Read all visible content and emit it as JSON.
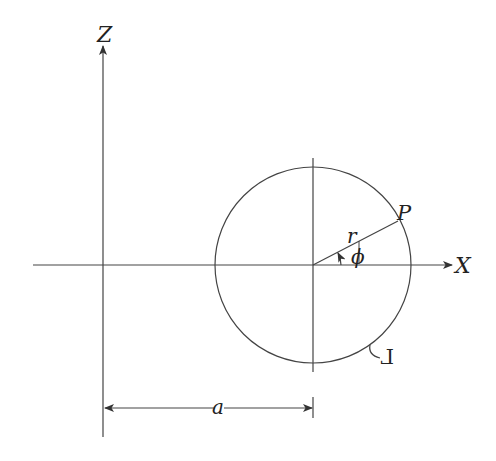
{
  "diagram": {
    "type": "geometry",
    "colors": {
      "stroke": "#444444",
      "text": "#222222",
      "background": "#ffffff"
    },
    "axes": {
      "x": {
        "label": "X"
      },
      "z": {
        "label": "Z"
      }
    },
    "circle": {
      "label": "Γ"
    },
    "point": {
      "label": "P"
    },
    "radius": {
      "label": "r"
    },
    "angle": {
      "label": "ϕ"
    },
    "distance": {
      "label": "a"
    }
  }
}
